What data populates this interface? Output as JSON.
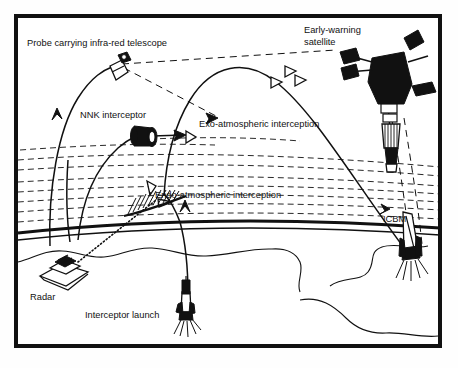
{
  "figure": {
    "type": "technical-diagram",
    "background_color": "#ffffff",
    "ink_color": "#111111",
    "frame": {
      "x": 14,
      "y": 14,
      "width": 428,
      "height": 334,
      "border_width": 4
    }
  },
  "labels": {
    "probe": "Probe carrying infra-red telescope",
    "nnk": "NNK interceptor",
    "satellite_line1": "Early-warning",
    "satellite_line2": "satellite",
    "exo": "Exo-atmospheric interception",
    "endo": "Endo-atmospheric interception",
    "icbm": "ICBM",
    "radar": "Radar",
    "launch": "Interceptor launch"
  },
  "elements": [
    {
      "name": "early-warning-satellite",
      "kind": "spacecraft",
      "x": 388,
      "y": 78
    },
    {
      "name": "icbm-missile",
      "kind": "missile",
      "x": 410,
      "y": 255
    },
    {
      "name": "infra-red-probe",
      "kind": "probe",
      "x": 117,
      "y": 68
    },
    {
      "name": "nnk-interceptor",
      "kind": "kill-vehicle",
      "x": 143,
      "y": 135
    },
    {
      "name": "radar-station",
      "kind": "ground-radar",
      "x": 62,
      "y": 274
    },
    {
      "name": "interceptor-rocket",
      "kind": "rocket",
      "x": 186,
      "y": 303
    },
    {
      "name": "exo-warhead-1",
      "kind": "reentry-vehicle",
      "x": 289,
      "y": 71
    },
    {
      "name": "exo-warhead-2",
      "kind": "reentry-vehicle",
      "x": 299,
      "y": 79
    },
    {
      "name": "exo-warhead-3",
      "kind": "reentry-vehicle",
      "x": 276,
      "y": 81
    },
    {
      "name": "exo-target-warhead",
      "kind": "reentry-vehicle",
      "x": 190,
      "y": 136
    },
    {
      "name": "endo-warhead-upper",
      "kind": "reentry-vehicle",
      "x": 151,
      "y": 188
    },
    {
      "name": "endo-warhead-lower",
      "kind": "reentry-vehicle",
      "x": 165,
      "y": 203
    }
  ],
  "annotations": {
    "atmosphere_band": "dashed layered atmosphere",
    "radar_beam": "dotted radar beam to endo intercept point",
    "sensor_lines": "dashed sightlines from probe and satellite"
  }
}
